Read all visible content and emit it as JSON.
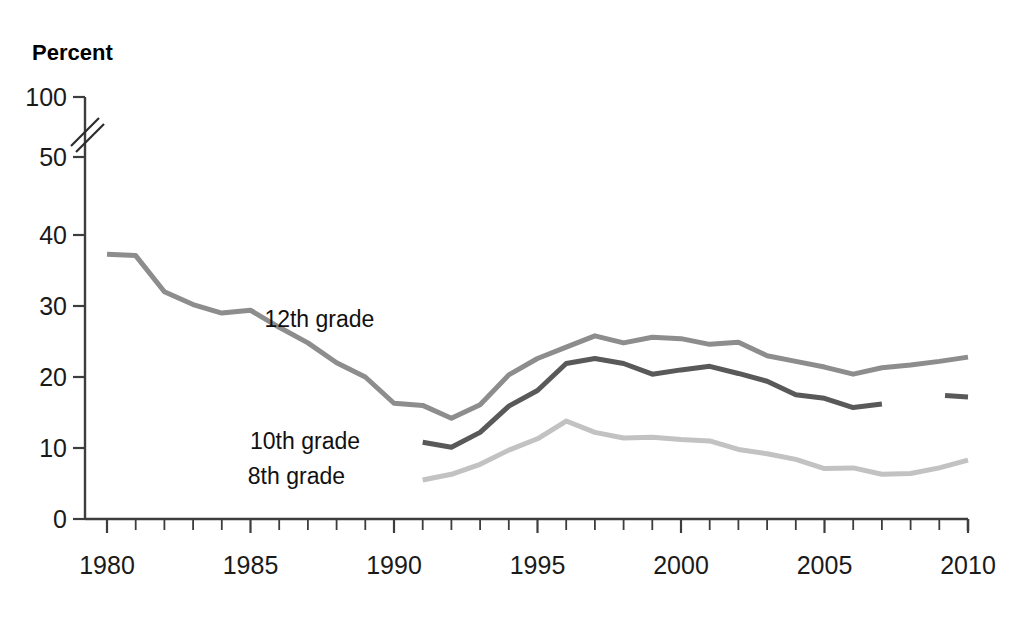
{
  "chart_data": {
    "type": "line",
    "title": "",
    "ylabel": "Percent",
    "xlabel": "",
    "xlim": [
      1980,
      2010
    ],
    "ylim": [
      0,
      100
    ],
    "y_ticks": [
      0,
      10,
      20,
      30,
      40,
      50,
      100
    ],
    "y_axis_break": {
      "between": [
        50,
        100
      ],
      "style": "double-slash"
    },
    "x_ticks_major": [
      1980,
      1985,
      1990,
      1995,
      2000,
      2005,
      2010
    ],
    "x_tick_interval": 1,
    "grid": false,
    "legend": "inline-labels",
    "series": [
      {
        "name": "12th grade",
        "color": "#8d8d8d",
        "label_year": 1987.4,
        "label_value": 28.2,
        "x": [
          1980,
          1981,
          1982,
          1983,
          1984,
          1985,
          1986,
          1987,
          1988,
          1989,
          1990,
          1991,
          1992,
          1993,
          1994,
          1995,
          1996,
          1997,
          1998,
          1999,
          2000,
          2001,
          2002,
          2003,
          2004,
          2005,
          2006,
          2007,
          2008,
          2009,
          2010
        ],
        "values": [
          37.3,
          37.1,
          32.0,
          30.2,
          29.0,
          29.4,
          27.0,
          24.8,
          22.0,
          20.0,
          16.3,
          16.0,
          14.2,
          16.1,
          20.3,
          22.6,
          24.2,
          25.8,
          24.8,
          25.6,
          25.4,
          24.6,
          24.9,
          23.0,
          22.2,
          21.4,
          20.4,
          21.3,
          21.7,
          22.2,
          22.8
        ]
      },
      {
        "name": "10th grade",
        "color": "#595959",
        "label_year": 1986.9,
        "label_value": 11.0,
        "x": [
          1991,
          1992,
          1993,
          1994,
          1995,
          1996,
          1997,
          1998,
          1999,
          2000,
          2001,
          2002,
          2003,
          2004,
          2005,
          2006,
          2007
        ],
        "values": [
          10.8,
          10.1,
          12.2,
          15.9,
          18.1,
          21.9,
          22.6,
          21.9,
          20.4,
          21.0,
          21.5,
          20.5,
          19.4,
          17.5,
          17.0,
          15.7,
          16.2
        ],
        "gap_after": 2007,
        "segment2_x": [
          2009.2,
          2010
        ],
        "segment2_values": [
          17.4,
          17.2
        ]
      },
      {
        "name": "8th grade",
        "color": "#c2c2c2",
        "label_year": 1986.6,
        "label_value": 6.0,
        "x": [
          1991,
          1992,
          1993,
          1994,
          1995,
          1996,
          1997,
          1998,
          1999,
          2000,
          2001,
          2002,
          2003,
          2004,
          2005,
          2006,
          2007,
          2008,
          2009,
          2010
        ],
        "values": [
          5.5,
          6.3,
          7.7,
          9.7,
          11.3,
          13.8,
          12.2,
          11.4,
          11.5,
          11.2,
          11.0,
          9.8,
          9.2,
          8.4,
          7.1,
          7.2,
          6.3,
          6.4,
          7.2,
          8.3
        ]
      }
    ]
  },
  "axis": {
    "ylabel_text": "Percent",
    "y_tick_labels": [
      "100",
      "50",
      "40",
      "30",
      "20",
      "10",
      "0"
    ],
    "x_tick_labels": [
      "1980",
      "1985",
      "1990",
      "1995",
      "2000",
      "2005",
      "2010"
    ]
  },
  "series_labels": {
    "grade12": "12th grade",
    "grade10": "10th grade",
    "grade8": "8th grade"
  },
  "colors": {
    "grade12": "#8d8d8d",
    "grade10": "#595959",
    "grade8": "#c2c2c2",
    "axis": "#3d3d3d",
    "text": "#000000",
    "background": "#ffffff"
  }
}
